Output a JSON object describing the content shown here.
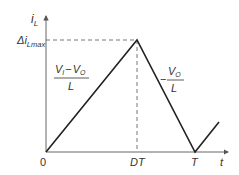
{
  "diagram": {
    "y_axis_label": {
      "main": "i",
      "sub": "L"
    },
    "x_axis_label": "t",
    "peak_label": {
      "prefix": "Δi",
      "sub": "Lmax"
    },
    "origin_label": "0",
    "x_ticks": [
      "DT",
      "T"
    ],
    "rise_slope": {
      "num_a": "V",
      "num_a_sub": "I",
      "minus": "−",
      "num_b": "V",
      "num_b_sub": "O",
      "den": "L"
    },
    "fall_slope": {
      "sign": "−",
      "num": "V",
      "num_sub": "O",
      "den": "L"
    },
    "colors": {
      "waveform": "#222222",
      "axis": "#555555",
      "dashed": "#666666",
      "text": "#333333"
    }
  }
}
